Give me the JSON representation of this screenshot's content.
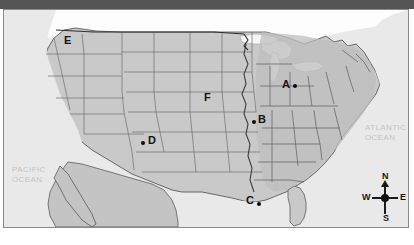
{
  "map": {
    "title": "United States reference map",
    "colors": {
      "land": "#c9c9c9",
      "land_dark": "#b4b4b4",
      "ocean": "#e9e9e9",
      "lake": "#f4f4f4",
      "border": "#6e6e6e",
      "coast": "#3a3a3a",
      "frame": "#8a8a8a",
      "top_band": "#555555",
      "marker": "#121212",
      "ocean_label": "#c4c4c4"
    },
    "markers": [
      {
        "id": "A",
        "label": "A",
        "dot": true,
        "dot_side": "right",
        "x": 281,
        "y": 70
      },
      {
        "id": "B",
        "label": "B",
        "dot": true,
        "dot_side": "left",
        "x": 256,
        "y": 109
      },
      {
        "id": "C",
        "label": "C",
        "dot": true,
        "dot_side": "right",
        "x": 244,
        "y": 190
      },
      {
        "id": "D",
        "label": "D",
        "dot": true,
        "dot_side": "left",
        "x": 146,
        "y": 130
      },
      {
        "id": "E",
        "label": "E",
        "dot": false,
        "dot_side": "none",
        "x": 62,
        "y": 30
      },
      {
        "id": "F",
        "label": "F",
        "dot": false,
        "dot_side": "none",
        "x": 202,
        "y": 87
      }
    ],
    "ocean_labels": [
      {
        "id": "pacific",
        "text": "PACIFIC\nOCEAN",
        "x": 8,
        "y": 155
      },
      {
        "id": "atlantic",
        "text": "ATLANTIC\nOCEAN",
        "x": 364,
        "y": 118
      }
    ],
    "compass": {
      "north": "N",
      "south": "S",
      "east": "E",
      "west": "W"
    }
  }
}
